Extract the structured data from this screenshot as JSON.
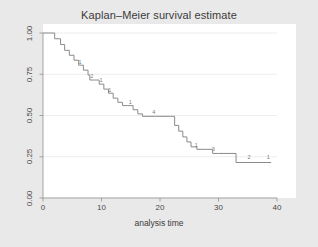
{
  "figure": {
    "background_color": "#e9e9e9",
    "plot_background_color": "#ffffff",
    "line_color": "#8a8a8a",
    "grid_color": "#ededed",
    "axis_color": "#8f8f8f",
    "text_color": "#3b3b3b"
  },
  "chart_data": {
    "type": "line",
    "subtype": "kaplan-meier-step",
    "title": "Kaplan–Meier survival estimate",
    "subtitle": "",
    "xlabel": "analysis time",
    "ylabel": "",
    "xlim": [
      0,
      40
    ],
    "ylim": [
      0,
      1
    ],
    "xticks": [
      0,
      10,
      20,
      30,
      40
    ],
    "xticklabels": [
      "0",
      "10",
      "20",
      "30",
      "40"
    ],
    "yticks": [
      0.0,
      0.25,
      0.5,
      0.75,
      1.0
    ],
    "yticklabels": [
      "0.00",
      "0.25",
      "0.50",
      "0.75",
      "1.00"
    ],
    "grid": true,
    "grid_axis": "y",
    "legend": false,
    "legend_position": "none",
    "series": [
      {
        "name": "survival",
        "step": "post",
        "x": [
          0.0,
          1.0,
          2.0,
          3.0,
          3.7,
          4.5,
          5.3,
          6.1,
          6.9,
          7.7,
          8.0,
          8.8,
          9.6,
          10.4,
          11.2,
          12.0,
          12.8,
          13.6,
          14.4,
          15.4,
          16.2,
          17.0,
          19.0,
          21.8,
          22.5,
          23.2,
          23.9,
          24.6,
          25.3,
          26.3,
          28.0,
          29.0,
          30.0,
          33.0,
          39.0
        ],
        "y": [
          1.0,
          1.0,
          0.965,
          0.93,
          0.895,
          0.865,
          0.835,
          0.805,
          0.775,
          0.745,
          0.715,
          0.715,
          0.69,
          0.66,
          0.635,
          0.605,
          0.58,
          0.56,
          0.56,
          0.535,
          0.51,
          0.495,
          0.495,
          0.495,
          0.44,
          0.405,
          0.37,
          0.34,
          0.31,
          0.295,
          0.295,
          0.27,
          0.27,
          0.215,
          0.215
        ]
      }
    ],
    "annotations": [
      {
        "label": "1",
        "x": 6.4,
        "y": 0.8
      },
      {
        "label": "2",
        "x": 8.4,
        "y": 0.715
      },
      {
        "label": "1",
        "x": 10.0,
        "y": 0.688
      },
      {
        "label": "1",
        "x": 11.5,
        "y": 0.633
      },
      {
        "label": "1",
        "x": 15.0,
        "y": 0.558
      },
      {
        "label": "4",
        "x": 19.0,
        "y": 0.498
      },
      {
        "label": "1",
        "x": 26.3,
        "y": 0.297
      },
      {
        "label": "3",
        "x": 29.2,
        "y": 0.272
      },
      {
        "label": "2",
        "x": 35.3,
        "y": 0.222
      },
      {
        "label": "1",
        "x": 38.6,
        "y": 0.222
      }
    ]
  }
}
